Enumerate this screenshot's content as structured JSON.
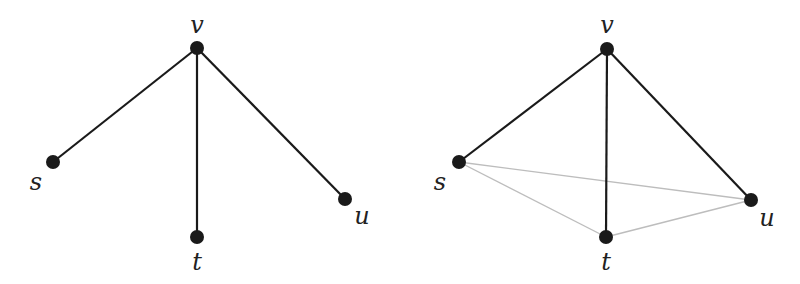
{
  "diagrams": [
    {
      "name": "star-graph",
      "nodes": [
        {
          "id": "v",
          "label": "v",
          "x": 197,
          "y": 48,
          "lx": 197,
          "ly": 33
        },
        {
          "id": "s",
          "label": "s",
          "x": 53,
          "y": 162,
          "lx": 36,
          "ly": 190
        },
        {
          "id": "t",
          "label": "t",
          "x": 197,
          "y": 237,
          "lx": 197,
          "ly": 270
        },
        {
          "id": "u",
          "label": "u",
          "x": 345,
          "y": 199,
          "lx": 362,
          "ly": 224
        }
      ],
      "edges": [
        {
          "from": "v",
          "to": "s",
          "style": "dark"
        },
        {
          "from": "v",
          "to": "t",
          "style": "dark"
        },
        {
          "from": "v",
          "to": "u",
          "style": "dark"
        }
      ]
    },
    {
      "name": "completed-graph",
      "nodes": [
        {
          "id": "v",
          "label": "v",
          "x": 607,
          "y": 49,
          "lx": 607,
          "ly": 33
        },
        {
          "id": "s",
          "label": "s",
          "x": 459,
          "y": 162,
          "lx": 440,
          "ly": 190
        },
        {
          "id": "t",
          "label": "t",
          "x": 606,
          "y": 237,
          "lx": 606,
          "ly": 270
        },
        {
          "id": "u",
          "label": "u",
          "x": 751,
          "y": 200,
          "lx": 767,
          "ly": 226
        }
      ],
      "edges": [
        {
          "from": "s",
          "to": "u",
          "style": "light"
        },
        {
          "from": "s",
          "to": "t",
          "style": "light"
        },
        {
          "from": "t",
          "to": "u",
          "style": "light"
        },
        {
          "from": "v",
          "to": "s",
          "style": "dark"
        },
        {
          "from": "v",
          "to": "t",
          "style": "dark"
        },
        {
          "from": "v",
          "to": "u",
          "style": "dark"
        }
      ]
    }
  ],
  "colors": {
    "dark_edge": "#1a1a1a",
    "light_edge": "#bdbdbd",
    "node": "#1a1a1a"
  }
}
